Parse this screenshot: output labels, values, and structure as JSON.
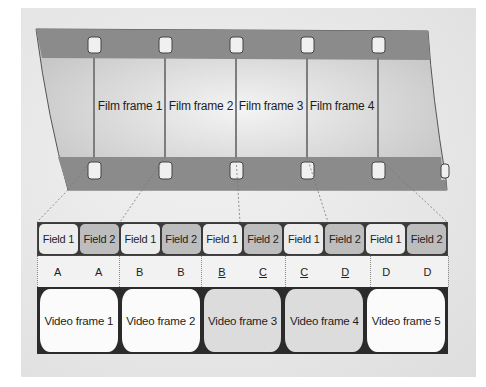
{
  "film_strip": {
    "frames": [
      {
        "label": "Film frame 1"
      },
      {
        "label": "Film frame 2"
      },
      {
        "label": "Film frame 3"
      },
      {
        "label": "Film frame 4"
      }
    ],
    "colors": {
      "sprocket_band": "#8a8a8a",
      "frame": "#d6d6d6",
      "divider": "#7a7a7a",
      "hole": "#f0f0f0"
    }
  },
  "fields": [
    {
      "label": "Field 1",
      "kind": "f1"
    },
    {
      "label": "Field 2",
      "kind": "f2"
    },
    {
      "label": "Field 1",
      "kind": "f1"
    },
    {
      "label": "Field 2",
      "kind": "f2"
    },
    {
      "label": "Field 1",
      "kind": "f1"
    },
    {
      "label": "Field 2",
      "kind": "f2"
    },
    {
      "label": "Field 1",
      "kind": "f1"
    },
    {
      "label": "Field 2",
      "kind": "f2"
    },
    {
      "label": "Field 1",
      "kind": "f1"
    },
    {
      "label": "Field 2",
      "kind": "f2"
    }
  ],
  "letters": [
    {
      "text": "A",
      "underlined": false
    },
    {
      "text": "A",
      "underlined": false
    },
    {
      "text": "B",
      "underlined": false
    },
    {
      "text": "B",
      "underlined": false
    },
    {
      "text": "B",
      "underlined": true
    },
    {
      "text": "C",
      "underlined": true
    },
    {
      "text": "C",
      "underlined": true
    },
    {
      "text": "D",
      "underlined": true
    },
    {
      "text": "D",
      "underlined": false
    },
    {
      "text": "D",
      "underlined": false
    }
  ],
  "video_frames": [
    {
      "label": "Video frame 1",
      "tone": "white"
    },
    {
      "label": "Video frame 2",
      "tone": "white"
    },
    {
      "label": "Video frame 3",
      "tone": "gray"
    },
    {
      "label": "Video frame 4",
      "tone": "gray"
    },
    {
      "label": "Video frame 5",
      "tone": "white"
    }
  ]
}
